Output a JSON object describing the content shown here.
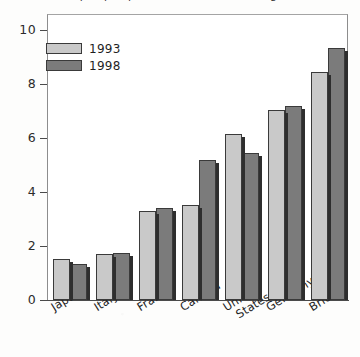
{
  "title": {
    "text": "Output per person in manufacturing",
    "cropped": true
  },
  "legend": {
    "position": "top-left-inside",
    "items": [
      {
        "label": "1993",
        "color": "#c9c9c9",
        "swatch": "light-gray-swatch"
      },
      {
        "label": "1998",
        "color": "#7b7b7b",
        "swatch": "dark-gray-swatch"
      }
    ]
  },
  "axes": {
    "y_ticks": [
      "0",
      "2",
      "4",
      "6",
      "8",
      "10"
    ],
    "y_tick_values": [
      0,
      2,
      4,
      6,
      8,
      10
    ]
  },
  "colors": {
    "series_1993": "#c9c9c9",
    "series_1998": "#7b7b7b",
    "bar_outline": "#3a3a3a",
    "bar_shadow": "#2e2e2e",
    "frame": "#8d8d8d",
    "axis": "#4a4a4a",
    "text": "#1f1f1f",
    "background": "#ffffff"
  },
  "chart_data": {
    "type": "bar",
    "title": "Output per person in manufacturing",
    "xlabel": "",
    "ylabel": "",
    "ylim": [
      0,
      10
    ],
    "yticks": [
      0,
      2,
      4,
      6,
      8,
      10
    ],
    "grid": false,
    "legend_position": "top-left",
    "categories": [
      "Japan",
      "Italy",
      "France",
      "Canada",
      "United States",
      "Germany",
      "Britain"
    ],
    "category_lines": [
      [
        "Japan"
      ],
      [
        "Italy"
      ],
      [
        "France"
      ],
      [
        "Canada"
      ],
      [
        "United",
        "States"
      ],
      [
        "Germany"
      ],
      [
        "Britain"
      ]
    ],
    "series": [
      {
        "name": "1993",
        "color": "#c9c9c9",
        "values": [
          1.5,
          1.7,
          3.3,
          3.5,
          6.15,
          7.05,
          8.45
        ]
      },
      {
        "name": "1998",
        "color": "#7b7b7b",
        "values": [
          1.35,
          1.75,
          3.4,
          5.2,
          5.45,
          7.2,
          9.35
        ]
      }
    ]
  }
}
